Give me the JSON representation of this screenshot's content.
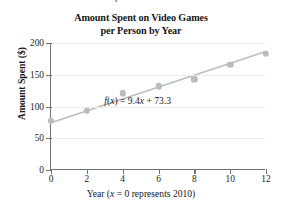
{
  "figure": {
    "clipped_top_text": "Amount Spent on Video Games",
    "title_line1": "Amount Spent on Video Games",
    "title_line2": "per Person by Year",
    "annotation_prefix": "f",
    "annotation_open": "(",
    "annotation_var": "x",
    "annotation_close": ")",
    "annotation_body": " = 9.4",
    "annotation_var2": "x",
    "annotation_tail": " + 73.3",
    "xaxis_title_pre": "Year (",
    "xaxis_title_var": "x",
    "xaxis_title_post": " = 0 represents 2010)",
    "yaxis_title": "Amount Spent ($)"
  },
  "chart_data": {
    "type": "scatter",
    "title": "Amount Spent on Video Games per Person by Year",
    "xlabel": "Year (x = 0 represents 2010)",
    "ylabel": "Amount Spent ($)",
    "xlim": [
      0,
      12
    ],
    "ylim": [
      0,
      200
    ],
    "xticks": [
      0,
      2,
      4,
      6,
      8,
      10,
      12
    ],
    "yticks": [
      0,
      50,
      100,
      150,
      200
    ],
    "xtick_labels": [
      "0",
      "2",
      "4",
      "6",
      "8",
      "10",
      "12"
    ],
    "ytick_labels": [
      "0",
      "50",
      "100",
      "150",
      "200"
    ],
    "grid": "horizontal",
    "legend": "none",
    "x": [
      0,
      2,
      4,
      6,
      8,
      10,
      12
    ],
    "values": [
      77,
      93,
      121,
      132,
      143,
      166,
      183
    ],
    "series": [
      {
        "name": "Amount spent per person",
        "kind": "scatter",
        "x": [
          0,
          2,
          4,
          6,
          8,
          10,
          12
        ],
        "values": [
          77,
          93,
          121,
          132,
          143,
          166,
          183
        ],
        "marker": "circle",
        "color": "#b9bcc0"
      },
      {
        "name": "Regression line f(x) = 9.4x + 73.3",
        "kind": "line",
        "x": [
          0,
          12
        ],
        "values": [
          73.3,
          186.1
        ],
        "color": "#b9bcc0"
      }
    ],
    "annotations": [
      {
        "text": "f(x) = 9.4x + 73.3",
        "x": 6.1,
        "y": 108
      }
    ],
    "fit": {
      "slope": 9.4,
      "intercept": 73.3,
      "equation": "f(x) = 9.4x + 73.3"
    }
  },
  "colors": {
    "marker": "#b9bcc0",
    "line": "#b9bcc0",
    "axis": "#6f7276",
    "grid": "#ececec",
    "text": "#16181a",
    "background": "#ffffff"
  }
}
